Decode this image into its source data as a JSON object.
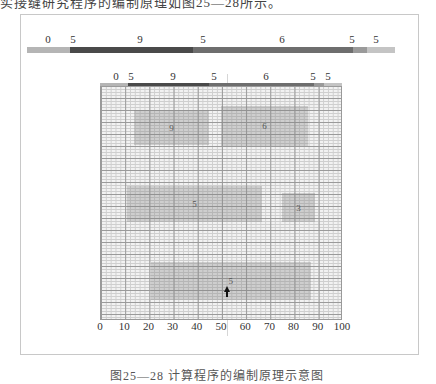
{
  "header": {
    "partial_text": "实接缝研究程序的编制原理如图25—28所示。"
  },
  "top_ruler": {
    "labels": [
      {
        "text": "0",
        "x": 48
      },
      {
        "text": "5",
        "x": 73
      },
      {
        "text": "9",
        "x": 140
      },
      {
        "text": "5",
        "x": 203
      },
      {
        "text": "6",
        "x": 282
      },
      {
        "text": "5",
        "x": 352
      },
      {
        "text": "5",
        "x": 376
      }
    ],
    "segments": [
      {
        "from": 0,
        "to": 43,
        "color": "#b5b5b5"
      },
      {
        "from": 43,
        "to": 166,
        "color": "#4a4a4a"
      },
      {
        "from": 166,
        "to": 326,
        "color": "#6e6e6e"
      },
      {
        "from": 326,
        "to": 340,
        "color": "#9a9a9a"
      },
      {
        "from": 340,
        "to": 368,
        "color": "#c4c4c4"
      }
    ]
  },
  "grid_ruler": {
    "labels": [
      {
        "text": "0",
        "x": 116
      },
      {
        "text": "5",
        "x": 131
      },
      {
        "text": "9",
        "x": 173
      },
      {
        "text": "5",
        "x": 214
      },
      {
        "text": "6",
        "x": 266
      },
      {
        "text": "5",
        "x": 313
      },
      {
        "text": "5",
        "x": 328
      }
    ]
  },
  "chart_data": {
    "type": "diagram",
    "title": "",
    "x_axis": {
      "min": 0,
      "max": 100,
      "ticks": [
        "0",
        "10",
        "20",
        "30",
        "40",
        "50",
        "60",
        "70",
        "80",
        "90",
        "100"
      ]
    },
    "blocks": [
      {
        "label": "9",
        "x0": 14,
        "x1": 45,
        "y_top": 110,
        "y_bottom": 145
      },
      {
        "label": "6",
        "x0": 50,
        "x1": 86,
        "y_top": 106,
        "y_bottom": 146
      },
      {
        "label": "5",
        "x0": 11,
        "x1": 67,
        "y_top": 186,
        "y_bottom": 222
      },
      {
        "label": "3",
        "x0": 75,
        "x1": 89,
        "y_top": 193,
        "y_bottom": 222
      },
      {
        "label": "5",
        "x0": 21,
        "x1": 87,
        "y_top": 262,
        "y_bottom": 300
      }
    ],
    "marker": {
      "type": "arrow-up",
      "x": 52
    }
  },
  "caption": {
    "partial_text": "图25—28  计算程序的编制原理示意图"
  }
}
